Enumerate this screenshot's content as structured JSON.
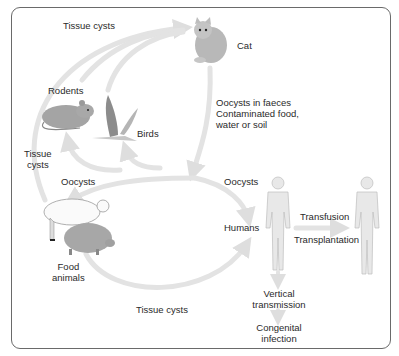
{
  "diagram": {
    "type": "life-cycle",
    "colors": {
      "frame": "#6a6a6a",
      "arrow": "#e2e2e2",
      "text": "#2a2a2a",
      "animal_fill": "#a9a9a9",
      "human_fill": "#e6e6e6"
    },
    "nodes": {
      "cat": "Cat",
      "rodents": "Rodents",
      "birds": "Birds",
      "food_animals_line1": "Food",
      "food_animals_line2": "animals",
      "humans": "Humans",
      "vertical_line1": "Vertical",
      "vertical_line2": "transmission",
      "congenital_line1": "Congenital",
      "congenital_line2": "infection"
    },
    "edge_labels": {
      "tissue_cysts_top": "Tissue cysts",
      "tissue_cysts_left_line1": "Tissue",
      "tissue_cysts_left_line2": "cysts",
      "oocysts_faeces_line1": "Oocysts in faeces",
      "oocysts_faeces_line2": "Contaminated food,",
      "oocysts_faeces_line3": "water or soil",
      "oocysts_left": "Oocysts",
      "oocysts_right": "Oocysts",
      "tissue_cysts_bottom": "Tissue cysts",
      "transfusion": "Transfusion",
      "transplantation": "Transplantation"
    },
    "edges": [
      {
        "from": "Rodents",
        "to": "Cat",
        "label": "Tissue cysts"
      },
      {
        "from": "Birds",
        "to": "Cat",
        "label": "Tissue cysts"
      },
      {
        "from": "Food animals",
        "to": "Cat",
        "label": "Tissue cysts"
      },
      {
        "from": "Cat",
        "to": "Environment",
        "label": "Oocysts in faeces / Contaminated food, water or soil"
      },
      {
        "from": "Environment",
        "to": "Rodents",
        "label": ""
      },
      {
        "from": "Environment",
        "to": "Birds",
        "label": ""
      },
      {
        "from": "Environment",
        "to": "Food animals",
        "label": "Oocysts"
      },
      {
        "from": "Environment",
        "to": "Humans",
        "label": "Oocysts"
      },
      {
        "from": "Food animals",
        "to": "Humans",
        "label": "Tissue cysts"
      },
      {
        "from": "Humans",
        "to": "Humans (recipient)",
        "label": "Transfusion / Transplantation"
      },
      {
        "from": "Humans",
        "to": "Congenital infection",
        "label": "Vertical transmission"
      }
    ]
  }
}
